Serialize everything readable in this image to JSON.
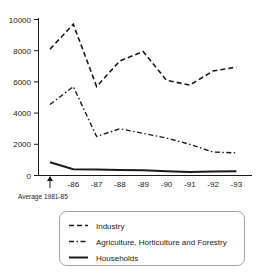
{
  "chart_data": {
    "type": "line",
    "title": "",
    "subtitle": "",
    "xlabel": "",
    "ylabel": "",
    "categories": [
      "Average 1981-85",
      "-86",
      "-87",
      "-88",
      "-89",
      "-90",
      "-91",
      "-92",
      "-93"
    ],
    "x_tick_labels": [
      "",
      "-86",
      "-87",
      "-88",
      "-89",
      "-90",
      "-91",
      "-92",
      "-93"
    ],
    "y_tick_labels": [
      "0",
      "2000",
      "4000",
      "6000",
      "8000",
      "10000"
    ],
    "y_ticks": [
      0,
      2000,
      4000,
      6000,
      8000,
      10000
    ],
    "ylim": [
      0,
      10000
    ],
    "grid": false,
    "legend_position": "bottom",
    "series": [
      {
        "name": "Industry",
        "style": "dashed",
        "values": [
          8100,
          9700,
          5700,
          7350,
          7950,
          6100,
          5800,
          6700,
          6950
        ]
      },
      {
        "name": "Agriculture, Horticulture and Forestry",
        "style": "dash-dot",
        "values": [
          4550,
          5700,
          2500,
          3000,
          2700,
          2400,
          2000,
          1500,
          1450
        ]
      },
      {
        "name": "Households",
        "style": "solid",
        "values": [
          850,
          400,
          380,
          350,
          330,
          280,
          230,
          250,
          280
        ]
      }
    ],
    "annotations": [
      {
        "name": "average-marker",
        "text": "Average 1981-85",
        "at_category": "Average 1981-85",
        "marker": "up-arrow"
      }
    ]
  },
  "axis": {
    "y": {
      "labels": [
        "10000",
        "8000",
        "6000",
        "4000",
        "2000",
        "0"
      ]
    },
    "x": {
      "labels": [
        "-86",
        "-87",
        "-88",
        "-89",
        "-90",
        "-91",
        "-92",
        "-93"
      ]
    }
  },
  "annotation": {
    "average_label": "Average 1981-85",
    "arrow_glyph": "↑"
  },
  "legend": {
    "items": [
      {
        "label": "Industry",
        "style": "dashed"
      },
      {
        "label": "Agriculture, Horticulture and Forestry",
        "style": "dash-dot"
      },
      {
        "label": "Households",
        "style": "solid"
      }
    ]
  },
  "colors": {
    "ink": "#1a1a1a",
    "legend_border": "#8a8a8a",
    "background": "#ffffff"
  }
}
